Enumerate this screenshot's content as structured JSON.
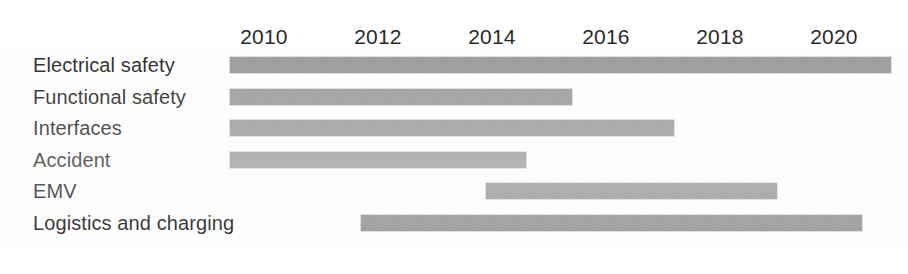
{
  "chart_data": {
    "type": "bar",
    "subtype": "gantt",
    "title": "",
    "xlabel": "",
    "ylabel": "",
    "xlim": [
      2009.0,
      2021.5
    ],
    "grid": false,
    "legend": null,
    "orientation": "horizontal",
    "bar_color": "#8a8a8a",
    "axis_position": "top",
    "x_ticks": [
      2010,
      2012,
      2014,
      2016,
      2018,
      2020
    ],
    "x_tick_labels": [
      "2010",
      "2012",
      "2014",
      "2016",
      "2018",
      "2020"
    ],
    "categories": [
      "Electrical safety",
      "Functional safety",
      "Interfaces",
      "Accident",
      "EMV",
      "Logistics and charging"
    ],
    "bars": [
      {
        "label": "Electrical safety",
        "start": 2009.4,
        "end": 2021.0
      },
      {
        "label": "Functional safety",
        "start": 2009.4,
        "end": 2015.4
      },
      {
        "label": "Interfaces",
        "start": 2009.4,
        "end": 2017.2
      },
      {
        "label": "Accident",
        "start": 2009.4,
        "end": 2014.6
      },
      {
        "label": "EMV",
        "start": 2013.9,
        "end": 2019.0
      },
      {
        "label": "Logistics and charging",
        "start": 2011.7,
        "end": 2020.5
      }
    ]
  }
}
